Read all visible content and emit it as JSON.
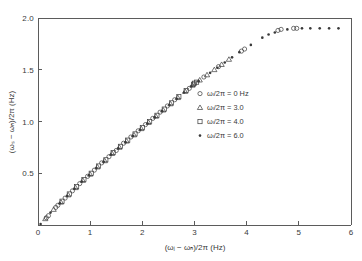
{
  "figure": {
    "background_color": "#ffffff",
    "ink_color": "#3a3a3a",
    "axis_color": "#5b5b5b"
  },
  "axes": {
    "x_title": "(ωᵢ − ωₕ)/2π  (Hz)",
    "y_title": "(ωₛ − ωₕ)/2π  (Hz)",
    "x_ticks": [
      "0",
      "1",
      "2",
      "3",
      "4",
      "5",
      "6"
    ],
    "y_ticks": [
      "0.5",
      "1.0",
      "1.5",
      "2.0"
    ]
  },
  "legend": {
    "entries": [
      {
        "marker": "circle-marker",
        "label": "ωₗ/2π = 0  Hz"
      },
      {
        "marker": "triangle-marker",
        "label": "ωₗ/2π = 3.0"
      },
      {
        "marker": "square-marker",
        "label": "ωₗ/2π = 4.0"
      },
      {
        "marker": "dot-marker",
        "label": "ωₗ/2π = 6.0"
      }
    ]
  },
  "chart_data": {
    "type": "scatter",
    "title": "",
    "xlabel": "(ωi − ωh)/2π  (Hz)",
    "ylabel": "(ωs − ωh)/2π  (Hz)",
    "xlim": [
      0,
      6
    ],
    "ylim": [
      0,
      2.0
    ],
    "xticks": [
      0,
      1,
      2,
      3,
      4,
      5,
      6
    ],
    "yticks": [
      0.5,
      1.0,
      1.5,
      2.0
    ],
    "grid": false,
    "legend_position": "center-right",
    "series": [
      {
        "name": "ωl/2π = 0 Hz",
        "marker": "circle",
        "points": [
          [
            0.16,
            0.07
          ],
          [
            0.2,
            0.09
          ],
          [
            0.34,
            0.17
          ],
          [
            0.38,
            0.19
          ],
          [
            0.52,
            0.26
          ],
          [
            0.66,
            0.33
          ],
          [
            0.8,
            0.4
          ],
          [
            0.95,
            0.47
          ],
          [
            1.08,
            0.53
          ],
          [
            1.22,
            0.6
          ],
          [
            1.36,
            0.66
          ],
          [
            1.5,
            0.72
          ],
          [
            1.64,
            0.79
          ],
          [
            1.78,
            0.85
          ],
          [
            1.92,
            0.91
          ],
          [
            2.06,
            0.97
          ],
          [
            2.2,
            1.03
          ],
          [
            2.34,
            1.09
          ],
          [
            2.48,
            1.15
          ],
          [
            2.62,
            1.21
          ],
          [
            2.9,
            1.32
          ],
          [
            3.18,
            1.43
          ],
          [
            3.46,
            1.53
          ],
          [
            3.9,
            1.68
          ],
          [
            3.96,
            1.7
          ],
          [
            4.6,
            1.88
          ],
          [
            4.66,
            1.89
          ],
          [
            4.9,
            1.9
          ],
          [
            4.96,
            1.9
          ]
        ]
      },
      {
        "name": "ωl/2π = 3.0",
        "marker": "triangle",
        "points": [
          [
            0.14,
            0.06
          ],
          [
            0.3,
            0.15
          ],
          [
            0.44,
            0.22
          ],
          [
            0.58,
            0.29
          ],
          [
            0.72,
            0.36
          ],
          [
            0.86,
            0.43
          ],
          [
            1.0,
            0.49
          ],
          [
            1.14,
            0.56
          ],
          [
            1.28,
            0.62
          ],
          [
            1.42,
            0.69
          ],
          [
            1.56,
            0.75
          ],
          [
            1.7,
            0.81
          ],
          [
            1.84,
            0.87
          ],
          [
            1.98,
            0.93
          ],
          [
            2.12,
            0.99
          ],
          [
            2.26,
            1.05
          ],
          [
            2.4,
            1.11
          ],
          [
            2.54,
            1.17
          ],
          [
            2.68,
            1.23
          ],
          [
            2.82,
            1.29
          ],
          [
            2.96,
            1.35
          ],
          [
            3.1,
            1.4
          ],
          [
            3.24,
            1.45
          ],
          [
            3.38,
            1.5
          ],
          [
            3.52,
            1.55
          ],
          [
            3.66,
            1.6
          ]
        ]
      },
      {
        "name": "ωl/2π = 4.0",
        "marker": "square",
        "points": [
          [
            0.46,
            0.23
          ],
          [
            0.6,
            0.3
          ],
          [
            0.74,
            0.37
          ],
          [
            0.88,
            0.44
          ],
          [
            1.02,
            0.5
          ],
          [
            1.16,
            0.57
          ],
          [
            1.3,
            0.63
          ],
          [
            1.44,
            0.7
          ],
          [
            1.58,
            0.76
          ],
          [
            1.72,
            0.82
          ],
          [
            1.86,
            0.88
          ],
          [
            2.0,
            0.94
          ],
          [
            2.14,
            1.0
          ],
          [
            2.28,
            1.06
          ],
          [
            2.42,
            1.12
          ],
          [
            2.56,
            1.18
          ],
          [
            2.7,
            1.24
          ],
          [
            2.84,
            1.3
          ],
          [
            2.98,
            1.36
          ],
          [
            3.0,
            1.37
          ],
          [
            3.04,
            1.38
          ]
        ]
      },
      {
        "name": "ωl/2π = 6.0",
        "marker": "dot",
        "points": [
          [
            0.05,
            0.01
          ],
          [
            0.24,
            0.12
          ],
          [
            0.42,
            0.21
          ],
          [
            0.56,
            0.28
          ],
          [
            0.7,
            0.35
          ],
          [
            0.84,
            0.42
          ],
          [
            0.98,
            0.48
          ],
          [
            1.12,
            0.55
          ],
          [
            1.26,
            0.61
          ],
          [
            1.4,
            0.68
          ],
          [
            1.54,
            0.74
          ],
          [
            1.68,
            0.8
          ],
          [
            1.82,
            0.86
          ],
          [
            1.96,
            0.92
          ],
          [
            2.1,
            0.98
          ],
          [
            2.24,
            1.04
          ],
          [
            2.38,
            1.1
          ],
          [
            2.52,
            1.16
          ],
          [
            2.66,
            1.22
          ],
          [
            2.8,
            1.28
          ],
          [
            2.94,
            1.34
          ],
          [
            3.08,
            1.39
          ],
          [
            3.3,
            1.47
          ],
          [
            3.44,
            1.52
          ],
          [
            3.58,
            1.57
          ],
          [
            3.72,
            1.62
          ],
          [
            3.86,
            1.67
          ],
          [
            4.08,
            1.74
          ],
          [
            4.3,
            1.81
          ],
          [
            4.42,
            1.84
          ],
          [
            4.54,
            1.86
          ],
          [
            4.78,
            1.89
          ],
          [
            5.06,
            1.9
          ],
          [
            5.22,
            1.9
          ],
          [
            5.4,
            1.9
          ],
          [
            5.58,
            1.9
          ],
          [
            5.76,
            1.9
          ]
        ]
      }
    ]
  }
}
